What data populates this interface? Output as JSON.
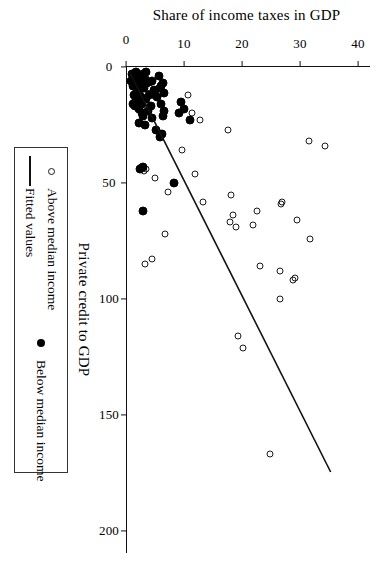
{
  "figure": {
    "orientation": "rotated-90-clockwise",
    "background": "#ffffff",
    "ink_color": "#000000"
  },
  "legend": {
    "position": "below-axis",
    "entries": [
      {
        "label": "Above median income",
        "marker": "open-circle"
      },
      {
        "label": "Below median income",
        "marker": "filled-circle"
      },
      {
        "label": "Fitted values",
        "marker": "line"
      }
    ]
  },
  "chart_data": {
    "type": "scatter",
    "title": "",
    "xlabel": "Private credit to GDP",
    "ylabel": "Share of income taxes in GDP",
    "xlim": [
      0,
      210
    ],
    "ylim": [
      0,
      42
    ],
    "xticks": [
      0,
      50,
      100,
      150,
      200
    ],
    "yticks": [
      0,
      10,
      20,
      30,
      40
    ],
    "xtick_labels": [
      "0",
      "50",
      "100",
      "150",
      "200"
    ],
    "ytick_labels": [
      "0",
      "10",
      "20",
      "30",
      "40"
    ],
    "grid": false,
    "legend_position": "below",
    "series": [
      {
        "name": "Above median income",
        "marker": "open-circle",
        "color": "#1a1a1a",
        "points": [
          [
            167,
            24.8
          ],
          [
            121,
            20.2
          ],
          [
            116,
            19.2
          ],
          [
            100,
            26.5
          ],
          [
            92,
            28.8
          ],
          [
            91,
            29.1
          ],
          [
            88,
            26.5
          ],
          [
            86,
            23.1
          ],
          [
            85,
            3.2
          ],
          [
            83,
            4.4
          ],
          [
            74,
            31.7
          ],
          [
            72,
            6.7
          ],
          [
            69,
            18.9
          ],
          [
            68,
            21.8
          ],
          [
            67,
            17.9
          ],
          [
            66,
            29.5
          ],
          [
            64,
            18.5
          ],
          [
            62,
            22.6
          ],
          [
            59,
            26.6
          ],
          [
            58,
            26.8
          ],
          [
            58,
            13.2
          ],
          [
            55,
            18.1
          ],
          [
            54,
            7.2
          ],
          [
            48,
            5.0
          ],
          [
            46,
            11.8
          ],
          [
            45,
            3.1
          ],
          [
            44,
            3.4
          ],
          [
            43,
            2.6
          ],
          [
            36,
            9.6
          ],
          [
            34,
            34.2
          ],
          [
            32,
            31.5
          ],
          [
            27,
            17.5
          ],
          [
            23,
            12.7
          ],
          [
            20,
            11.3
          ],
          [
            13,
            3.6
          ],
          [
            12,
            10.6
          ],
          [
            11,
            6.0
          ],
          [
            10,
            5.2
          ],
          [
            9,
            4.1
          ],
          [
            6,
            2.6
          ],
          [
            5,
            1.9
          ]
        ]
      },
      {
        "name": "Below median income",
        "marker": "filled-circle",
        "color": "#000000",
        "points": [
          [
            62,
            3.0
          ],
          [
            50,
            8.2
          ],
          [
            44,
            2.4
          ],
          [
            43,
            2.9
          ],
          [
            30,
            5.8
          ],
          [
            29,
            6.2
          ],
          [
            27,
            5.1
          ],
          [
            25,
            3.2
          ],
          [
            24,
            2.3
          ],
          [
            23,
            11.1
          ],
          [
            22,
            4.5
          ],
          [
            21,
            3.0
          ],
          [
            20,
            9.2
          ],
          [
            20,
            2.8
          ],
          [
            19,
            3.8
          ],
          [
            18,
            9.9
          ],
          [
            18,
            2.2
          ],
          [
            17,
            4.3
          ],
          [
            17,
            1.6
          ],
          [
            16,
            2.7
          ],
          [
            16,
            6.1
          ],
          [
            15,
            9.5
          ],
          [
            15,
            2.1
          ],
          [
            14,
            3.5
          ],
          [
            14,
            1.8
          ],
          [
            13,
            5.3
          ],
          [
            13,
            2.6
          ],
          [
            12,
            3.9
          ],
          [
            12,
            1.4
          ],
          [
            11,
            6.5
          ],
          [
            11,
            2.3
          ],
          [
            10,
            4.8
          ],
          [
            10,
            1.9
          ],
          [
            9,
            3.1
          ],
          [
            9,
            5.9
          ],
          [
            8,
            2.5
          ],
          [
            8,
            1.2
          ],
          [
            7,
            3.7
          ],
          [
            7,
            6.3
          ],
          [
            6,
            2.0
          ],
          [
            6,
            4.4
          ],
          [
            5,
            1.5
          ],
          [
            5,
            3.3
          ],
          [
            4,
            2.2
          ],
          [
            4,
            5.6
          ],
          [
            3,
            1.1
          ],
          [
            3,
            2.9
          ],
          [
            2,
            1.7
          ],
          [
            2,
            3.4
          ],
          [
            6,
            0.9
          ],
          [
            8,
            6.0
          ],
          [
            12,
            5.0
          ],
          [
            16,
            1.2
          ],
          [
            19,
            6.5
          ],
          [
            21,
            6.3
          ]
        ]
      }
    ],
    "fit_line": {
      "name": "Fitted values",
      "color": "#111111",
      "x_start": 2,
      "y_start": 0.4,
      "x_end": 175,
      "y_end": 35.2
    }
  }
}
